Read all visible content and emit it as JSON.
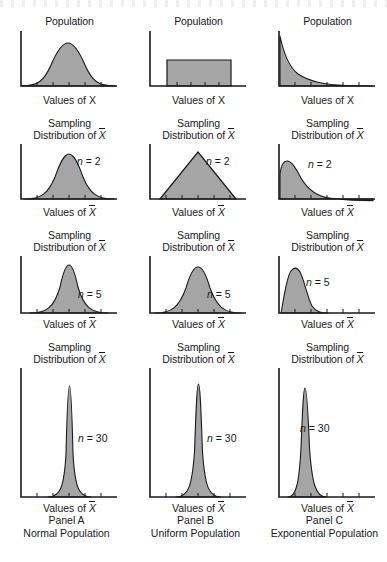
{
  "figure": {
    "axis_x_label_population": "Values of X",
    "axis_x_label_sampling": "Values of X̄",
    "sampling_title_line1": "Sampling",
    "sampling_title_line2": "Distribution of",
    "population_title": "Population",
    "colors": {
      "fill": "#a5a5a5",
      "stroke": "#1a1a1a",
      "axis": "#1a1a1a",
      "background": "#ffffff"
    }
  },
  "panels": [
    {
      "id": "panel-a",
      "caption_line1": "Panel A",
      "caption_line2": "Normal Population",
      "population_label": "Population",
      "rows": [
        {
          "kind": "population",
          "title": "Population",
          "n_label": "",
          "axis_label": "Values of X"
        },
        {
          "kind": "sampling",
          "n_label": "n = 2",
          "n_value": 2,
          "axis_label": "Values of X̄"
        },
        {
          "kind": "sampling",
          "n_label": "n = 5",
          "n_value": 5,
          "axis_label": "Values of X̄"
        },
        {
          "kind": "sampling",
          "n_label": "n = 30",
          "n_value": 30,
          "axis_label": "Values of X̄"
        }
      ]
    },
    {
      "id": "panel-b",
      "caption_line1": "Panel B",
      "caption_line2": "Uniform Population",
      "population_label": "Population",
      "rows": [
        {
          "kind": "population",
          "title": "Population",
          "n_label": "",
          "axis_label": "Values of X"
        },
        {
          "kind": "sampling",
          "n_label": "n = 2",
          "n_value": 2,
          "axis_label": "Values of X̄"
        },
        {
          "kind": "sampling",
          "n_label": "n = 5",
          "n_value": 5,
          "axis_label": "Values of X̄"
        },
        {
          "kind": "sampling",
          "n_label": "n = 30",
          "n_value": 30,
          "axis_label": "Values of X̄"
        }
      ]
    },
    {
      "id": "panel-c",
      "caption_line1": "Panel C",
      "caption_line2": "Exponential Population",
      "population_label": "Population",
      "rows": [
        {
          "kind": "population",
          "title": "Population",
          "n_label": "",
          "axis_label": "Values of X"
        },
        {
          "kind": "sampling",
          "n_label": "n = 2",
          "n_value": 2,
          "axis_label": "Values of X̄"
        },
        {
          "kind": "sampling",
          "n_label": "n = 5",
          "n_value": 5,
          "axis_label": "Values of X̄"
        },
        {
          "kind": "sampling",
          "n_label": "n = 30",
          "n_value": 30,
          "axis_label": "Values of X̄"
        }
      ]
    }
  ],
  "chart_data": {
    "type": "line",
    "layout": {
      "rows": 4,
      "cols": 3,
      "grid": false,
      "legend": "none",
      "axis_ticks_labeled": false
    },
    "xlabel_population": "Values of X",
    "xlabel_sampling": "Values of X̄",
    "row_sample_sizes": [
      null,
      2,
      5,
      30
    ],
    "column_populations": [
      "Normal",
      "Uniform",
      "Exponential"
    ],
    "charts": [
      {
        "panel": "A",
        "population": "Normal",
        "row": "population",
        "distribution": "normal",
        "mean": 0.5,
        "sd": 0.135,
        "peak_height_rel": 0.62,
        "skew": 0,
        "xlim": [
          0,
          1
        ],
        "ylim": [
          0,
          1
        ]
      },
      {
        "panel": "A",
        "population": "Normal",
        "row": "n = 2",
        "n": 2,
        "distribution": "normal",
        "mean": 0.5,
        "sd": 0.095,
        "peak_height_rel": 0.78,
        "skew": 0,
        "xlim": [
          0,
          1
        ],
        "ylim": [
          0,
          1
        ]
      },
      {
        "panel": "A",
        "population": "Normal",
        "row": "n = 5",
        "n": 5,
        "distribution": "normal",
        "mean": 0.5,
        "sd": 0.062,
        "peak_height_rel": 0.85,
        "skew": 0,
        "xlim": [
          0,
          1
        ],
        "ylim": [
          0,
          1
        ]
      },
      {
        "panel": "A",
        "population": "Normal",
        "row": "n = 30",
        "n": 30,
        "distribution": "normal",
        "mean": 0.5,
        "sd": 0.028,
        "peak_height_rel": 0.92,
        "skew": 0,
        "xlim": [
          0,
          1
        ],
        "ylim": [
          0,
          1
        ]
      },
      {
        "panel": "B",
        "population": "Uniform",
        "row": "population",
        "distribution": "uniform",
        "a": 0.18,
        "b": 0.83,
        "peak_height_rel": 0.5,
        "skew": 0,
        "xlim": [
          0,
          1
        ],
        "ylim": [
          0,
          1
        ]
      },
      {
        "panel": "B",
        "population": "Uniform",
        "row": "n = 2",
        "n": 2,
        "distribution": "triangular",
        "a": 0.1,
        "mode": 0.5,
        "b": 0.9,
        "peak_height_rel": 0.88,
        "skew": 0,
        "xlim": [
          0,
          1
        ],
        "ylim": [
          0,
          1
        ]
      },
      {
        "panel": "B",
        "population": "Uniform",
        "row": "n = 5",
        "n": 5,
        "distribution": "normal",
        "mean": 0.5,
        "sd": 0.105,
        "peak_height_rel": 0.8,
        "skew": 0,
        "xlim": [
          0,
          1
        ],
        "ylim": [
          0,
          1
        ]
      },
      {
        "panel": "B",
        "population": "Uniform",
        "row": "n = 30",
        "n": 30,
        "distribution": "normal",
        "mean": 0.5,
        "sd": 0.032,
        "peak_height_rel": 0.9,
        "skew": 0,
        "xlim": [
          0,
          1
        ],
        "ylim": [
          0,
          1
        ]
      },
      {
        "panel": "C",
        "population": "Exponential",
        "row": "population",
        "distribution": "exponential",
        "rate": 4.2,
        "peak_height_rel": 1.0,
        "skew": 2.0,
        "xlim": [
          0,
          1
        ],
        "ylim": [
          0,
          1
        ]
      },
      {
        "panel": "C",
        "population": "Exponential",
        "row": "n = 2",
        "n": 2,
        "distribution": "gamma",
        "shape": 2,
        "mode": 0.1,
        "peak_height_rel": 0.72,
        "skew": 1.41,
        "xlim": [
          0,
          1
        ],
        "ylim": [
          0,
          1
        ]
      },
      {
        "panel": "C",
        "population": "Exponential",
        "row": "n = 5",
        "n": 5,
        "distribution": "gamma",
        "shape": 5,
        "mode": 0.17,
        "peak_height_rel": 0.82,
        "skew": 0.89,
        "xlim": [
          0,
          1
        ],
        "ylim": [
          0,
          1
        ]
      },
      {
        "panel": "C",
        "population": "Exponential",
        "row": "n = 30",
        "n": 30,
        "distribution": "gamma",
        "shape": 30,
        "mode": 0.2,
        "peak_height_rel": 0.9,
        "skew": 0.37,
        "xlim": [
          0,
          1
        ],
        "ylim": [
          0,
          1
        ]
      }
    ]
  }
}
